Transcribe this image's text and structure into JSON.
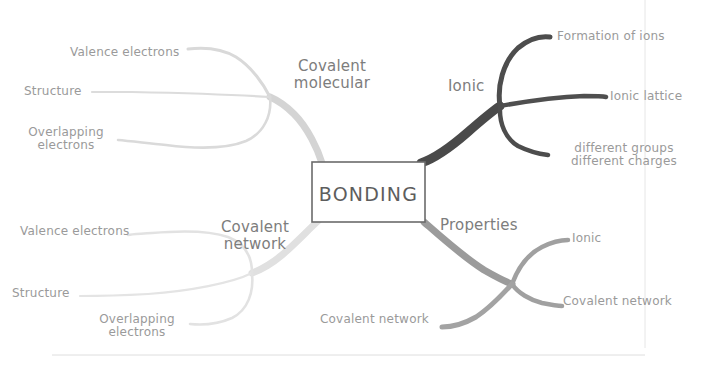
{
  "canvas": {
    "width": 706,
    "height": 375,
    "background": "#ffffff"
  },
  "center": {
    "label": "BONDING",
    "box": {
      "x": 312,
      "y": 162,
      "width": 113,
      "height": 60
    },
    "border_color": "#6b6b6b",
    "fill": "#ffffff"
  },
  "frame": {
    "vertical_rule_x": 645,
    "vertical_rule_color": "#e3e3e3",
    "bottom_rule_y": 355,
    "bottom_rule_color": "#dcdcdc"
  },
  "branches": [
    {
      "id": "covalent-molecular",
      "label": "Covalent\nmolecular",
      "color": "#d6d6d6",
      "label_pos": {
        "x": 284,
        "y": 58
      },
      "label_size": 15,
      "leaves": [
        {
          "id": "cm-valence-electrons",
          "label": "Valence electrons",
          "x": 70,
          "y": 46,
          "size": 12,
          "align": "left"
        },
        {
          "id": "cm-structure",
          "label": "Structure",
          "x": 24,
          "y": 85,
          "size": 12,
          "align": "left"
        },
        {
          "id": "cm-overlapping-electrons",
          "label": "Overlapping\nelectrons",
          "x": 24,
          "y": 126,
          "size": 12,
          "align": "left"
        }
      ]
    },
    {
      "id": "ionic",
      "label": "Ionic",
      "color": "#4a4a4a",
      "label_pos": {
        "x": 448,
        "y": 78
      },
      "label_size": 15,
      "leaves": [
        {
          "id": "ionic-formation-of-ions",
          "label": "Formation of ions",
          "x": 557,
          "y": 30,
          "size": 12,
          "align": "left"
        },
        {
          "id": "ionic-lattice",
          "label": "Ionic lattice",
          "x": 610,
          "y": 90,
          "size": 12,
          "align": "left"
        },
        {
          "id": "ionic-different-groups-charges",
          "label": "different groups\ndifferent charges",
          "x": 566,
          "y": 142,
          "size": 12,
          "align": "left"
        }
      ]
    },
    {
      "id": "covalent-network",
      "label": "Covalent\nnetwork",
      "color": "#e0e0e0",
      "label_pos": {
        "x": 210,
        "y": 219
      },
      "label_size": 15,
      "leaves": [
        {
          "id": "cn-valence-electrons",
          "label": "Valence electrons",
          "x": 20,
          "y": 225,
          "size": 12,
          "align": "left"
        },
        {
          "id": "cn-structure",
          "label": "Structure",
          "x": 12,
          "y": 287,
          "size": 12,
          "align": "left"
        },
        {
          "id": "cn-overlapping-electrons",
          "label": "Overlapping\nelectrons",
          "x": 95,
          "y": 313,
          "size": 12,
          "align": "left"
        }
      ]
    },
    {
      "id": "properties",
      "label": "Properties",
      "color": "#9b9b9b",
      "label_pos": {
        "x": 440,
        "y": 217
      },
      "label_size": 15,
      "leaves": [
        {
          "id": "properties-ionic",
          "label": "Ionic",
          "x": 572,
          "y": 232,
          "size": 12,
          "align": "left"
        },
        {
          "id": "properties-covalent-network-right",
          "label": "Covalent network",
          "x": 563,
          "y": 295,
          "size": 12,
          "align": "left"
        },
        {
          "id": "properties-covalent-network-bottom",
          "label": "Covalent network",
          "x": 320,
          "y": 313,
          "size": 12,
          "align": "left"
        }
      ]
    }
  ]
}
